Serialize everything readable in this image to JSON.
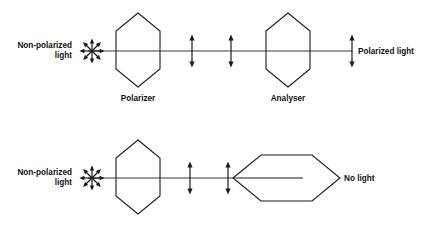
{
  "figure": {
    "stroke_color": "#1a1a1a",
    "beam_color": "#3a3a3a",
    "background_color": "#ffffff"
  },
  "rows": [
    {
      "id": "parallel-row",
      "input_label_line1": "Non-polarized",
      "input_label_line2": "light",
      "polarizer_label": "Polarizer",
      "analyser_label": "Analyser",
      "output_label": "Polarized light",
      "input_icon": "starburst-unpolarized-icon",
      "polarizer_orientation": "vertical",
      "analyser_orientation": "vertical",
      "polarization_arrows": 3,
      "result": "light transmitted"
    },
    {
      "id": "crossed-row",
      "input_label_line1": "Non-polarized",
      "input_label_line2": "light",
      "polarizer_label": "",
      "analyser_label": "",
      "output_label": "No light",
      "input_icon": "starburst-unpolarized-icon",
      "polarizer_orientation": "vertical",
      "analyser_orientation": "horizontal",
      "polarization_arrows": 2,
      "result": "light blocked"
    }
  ]
}
